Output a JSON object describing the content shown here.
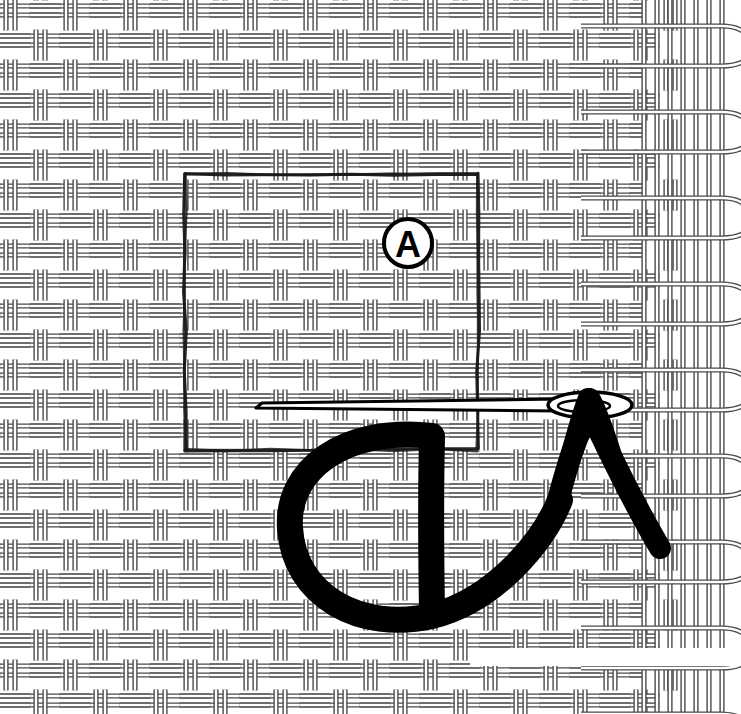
{
  "figure": {
    "kind": "needlework-instruction-diagram",
    "background_color": "#ffffff",
    "width": 741,
    "height": 714
  },
  "fabric": {
    "name": "basket-weave-fabric",
    "thread_color": "#4a4a4a",
    "thread_fill": "#ffffff",
    "cell_size": 30,
    "thread_width": 3,
    "pair_gap": 9,
    "region": {
      "x": 0,
      "y": 0,
      "width": 741,
      "height": 714
    },
    "notch": {
      "x": 470,
      "y": 648,
      "width": 271,
      "height": 18
    }
  },
  "selvedge": {
    "name": "selvedge-edge",
    "start_x": 640,
    "warp_count": 7,
    "warp_spacing": 13,
    "loop_count": 8,
    "loop_spacing": 86,
    "loop_radius": 26,
    "color": "#4a4a4a"
  },
  "guideline": {
    "name": "stitching-guideline-rectangle",
    "style": "hand-drawn-ink",
    "color": "#1a1a1a",
    "x": 185,
    "y": 174,
    "width": 293,
    "height": 276,
    "stroke_width": 3
  },
  "callout": {
    "name": "callout-a",
    "letter": "A",
    "cx": 408,
    "cy": 243,
    "radius": 24,
    "ring_width": 4,
    "font_size": 36,
    "color": "#000000"
  },
  "needle": {
    "name": "sewing-needle",
    "color": "#000000",
    "tip_x": 256,
    "tip_y": 408,
    "shaft_y": 404,
    "eye_cx": 590,
    "eye_cy": 405,
    "eye_rx": 42,
    "eye_ry": 13,
    "length": 380
  },
  "thread": {
    "name": "thread-loop",
    "color": "#000000",
    "stroke_width": 26,
    "tail_end_x": 660,
    "tail_end_y": 548,
    "loop_left_x": 288,
    "loop_bottom_y": 612
  },
  "colors": {
    "ink_black": "#000000",
    "weave_gray": "#4a4a4a",
    "paper_white": "#ffffff"
  }
}
